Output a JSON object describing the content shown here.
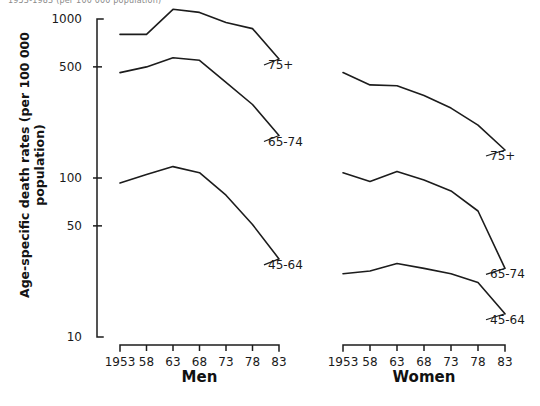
{
  "figure": {
    "top_caption": "1953-1983 (per 100 000 population)",
    "ylabel": "Age-specific death rates (per 100 000 population)"
  },
  "chart_data": {
    "type": "line",
    "title": "",
    "xlabel": "",
    "ylabel": "Age-specific death rates (per 100 000 population)",
    "yscale": "log",
    "ylim": [
      10,
      1000
    ],
    "ytick_labels": [
      "1000",
      "500",
      "100",
      "50",
      "10"
    ],
    "ytick_values": [
      1000,
      500,
      100,
      50,
      10
    ],
    "grid": false,
    "legend_position": "inline-right-of-each-line",
    "x": [
      1953,
      1958,
      1963,
      1968,
      1973,
      1978,
      1983
    ],
    "xtick_labels": [
      "1953",
      "58",
      "63",
      "68",
      "73",
      "78",
      "83"
    ],
    "panels": [
      {
        "name": "Men",
        "label": "Men",
        "series": [
          {
            "name": "75+",
            "label": "75+",
            "values": [
              800,
              800,
              1150,
              1100,
              950,
              870,
              560
            ]
          },
          {
            "name": "65-74",
            "label": "65-74",
            "values": [
              460,
              500,
              570,
              550,
              400,
              290,
              185
            ]
          },
          {
            "name": "45-64",
            "label": "45-64",
            "values": [
              93,
              105,
              118,
              108,
              78,
              51,
              31
            ]
          }
        ]
      },
      {
        "name": "Women",
        "label": "Women",
        "series": [
          {
            "name": "75+",
            "label": "75+",
            "values": [
              460,
              385,
              380,
              330,
              275,
              215,
              150
            ]
          },
          {
            "name": "65-74",
            "label": "65-74",
            "values": [
              108,
              95,
              110,
              97,
              83,
              62,
              27
            ]
          },
          {
            "name": "45-64",
            "label": "45-64",
            "values": [
              25,
              26,
              29,
              27,
              25,
              22,
              14
            ]
          }
        ]
      }
    ]
  },
  "colors": {
    "ink": "#1c1c1c",
    "background": "#ffffff"
  }
}
